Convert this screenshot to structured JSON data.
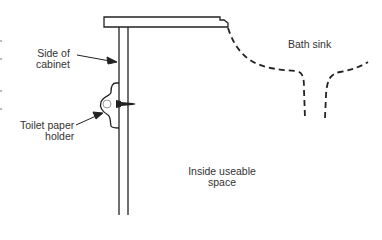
{
  "diagram": {
    "type": "cross-section",
    "labels": {
      "side_of_cabinet": [
        "Side of",
        "cabinet"
      ],
      "toilet_paper_holder": [
        "Toilet paper",
        "holder"
      ],
      "bath_sink": "Bath sink",
      "inside_useable_space": [
        "Inside useable",
        "space"
      ]
    },
    "colors": {
      "line": "#222222",
      "text": "#333333",
      "background": "#ffffff"
    }
  }
}
